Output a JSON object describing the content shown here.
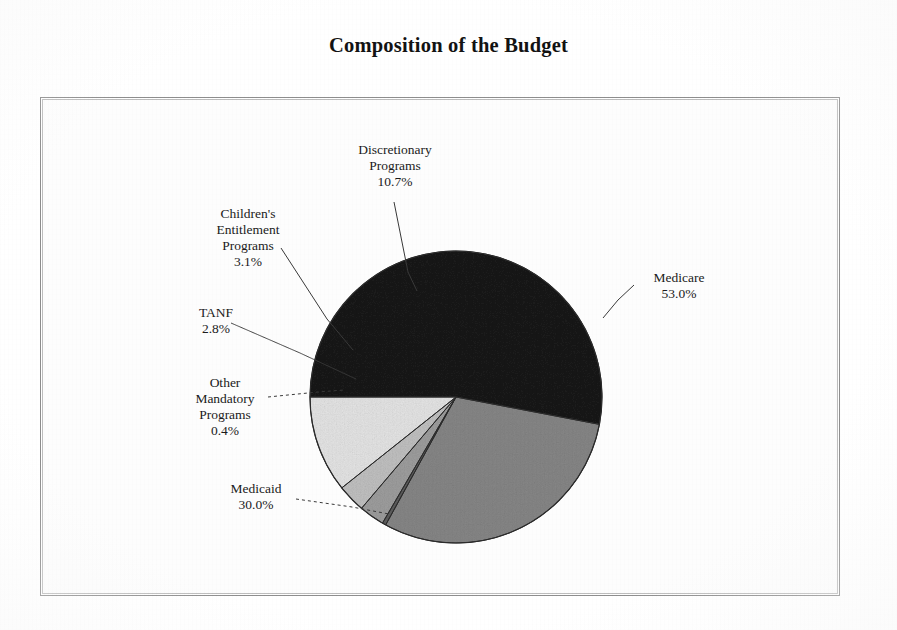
{
  "title": "Composition of the Budget",
  "chart_data": {
    "type": "pie",
    "title": "Composition of the Budget",
    "xlabel": "",
    "ylabel": "",
    "grid": false,
    "legend": "none (direct labels with leader lines)",
    "value_unit": "percent",
    "total": "100.0%",
    "categories": [
      "Medicare",
      "Medicaid",
      "Other Mandatory Programs",
      "TANF",
      "Children's Entitlement Programs",
      "Discretionary Programs"
    ],
    "values": [
      53.0,
      30.0,
      0.4,
      2.8,
      3.1,
      10.7
    ],
    "slices": [
      {
        "name": "Medicare",
        "label_lines": [
          "Medicare"
        ],
        "value": 53.0,
        "value_label": "53.0%",
        "color": "#1a1a1a",
        "start_deg": 0,
        "sweep_deg": 190.8
      },
      {
        "name": "Medicaid",
        "label_lines": [
          "Medicaid"
        ],
        "value": 30.0,
        "value_label": "30.0%",
        "color": "#868686",
        "start_deg": 190.8,
        "sweep_deg": 108.0
      },
      {
        "name": "Other Mandatory Programs",
        "label_lines": [
          "Other",
          "Mandatory",
          "Programs"
        ],
        "value": 0.4,
        "value_label": "0.4%",
        "color": "#5d5d5d",
        "start_deg": 298.8,
        "sweep_deg": 1.44
      },
      {
        "name": "TANF",
        "label_lines": [
          "TANF"
        ],
        "value": 2.8,
        "value_label": "2.8%",
        "color": "#9d9d9d",
        "start_deg": 300.24,
        "sweep_deg": 10.08
      },
      {
        "name": "Children's Entitlement Programs",
        "label_lines": [
          "Children's",
          "Entitlement",
          "Programs"
        ],
        "value": 3.1,
        "value_label": "3.1%",
        "color": "#c0c0c0",
        "start_deg": 310.32,
        "sweep_deg": 11.16
      },
      {
        "name": "Discretionary Programs",
        "label_lines": [
          "Discretionary",
          "Programs"
        ],
        "value": 10.7,
        "value_label": "10.7%",
        "color": "#e4e4e4",
        "start_deg": 321.48,
        "sweep_deg": 38.52
      }
    ]
  },
  "labels": {
    "discretionary": {
      "line1": "Discretionary",
      "line2": "Programs",
      "pct": "10.7%"
    },
    "childrens": {
      "line1": "Children's",
      "line2": "Entitlement",
      "line3": "Programs",
      "pct": "3.1%"
    },
    "tanf": {
      "line1": "TANF",
      "pct": "2.8%"
    },
    "other_mandatory": {
      "line1": "Other",
      "line2": "Mandatory",
      "line3": "Programs",
      "pct": "0.4%"
    },
    "medicaid": {
      "line1": "Medicaid",
      "pct": "30.0%"
    },
    "medicare": {
      "line1": "Medicare",
      "pct": "53.0%"
    }
  },
  "colors": {
    "medicare": "#1a1a1a",
    "medicaid": "#868686",
    "other_mandatory": "#5d5d5d",
    "tanf": "#9d9d9d",
    "childrens": "#c0c0c0",
    "discretionary": "#e4e4e4",
    "frame": "#8e8e8e",
    "text": "#1b1b1b",
    "background": "#ffffff"
  }
}
